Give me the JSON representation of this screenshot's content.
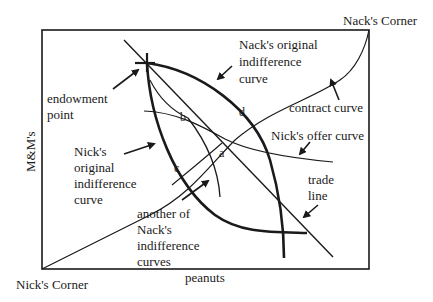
{
  "diagram": {
    "corners": {
      "top_right": "Nack's Corner",
      "bottom_left": "Nick's Corner"
    },
    "axes": {
      "x_label": "peanuts",
      "y_label": "M&M's"
    },
    "labels": {
      "endowment_1": "endowment",
      "endowment_2": "point",
      "nack_orig_1": "Nack's original",
      "nack_orig_2": "indifference",
      "nack_orig_3": "curve",
      "contract": "contract curve",
      "nick_offer": "Nick's offer curve",
      "nick_orig_1": "Nick's",
      "nick_orig_2": "original",
      "nick_orig_3": "indifference",
      "nick_orig_4": "curve",
      "trade_1": "trade",
      "trade_2": "line",
      "another_1": "another of",
      "another_2": "Nack's",
      "another_3": "indifference",
      "another_4": "curves"
    },
    "points": {
      "a": "a",
      "b": "b",
      "c": "c",
      "d": "d"
    },
    "colors": {
      "ink": "#1a1a1a",
      "background": "#ffffff"
    }
  }
}
